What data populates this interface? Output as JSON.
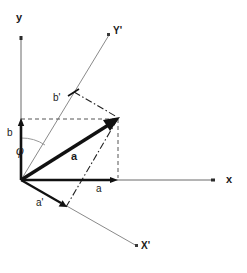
{
  "figure": {
    "name": "vector-component-transformation-diagram",
    "background_color": "#ffffff",
    "width": 247,
    "height": 273
  },
  "colors": {
    "axis": "#6b6b6b",
    "primed_axis": "#8a8a8a",
    "vector": "#111111",
    "dashed": "#555555",
    "dashdot": "#222222",
    "arc": "#9a9a9a",
    "text": "#1a1a1a"
  },
  "labels": {
    "y_axis": "y",
    "x_axis": "x",
    "y_prime_axis": "Y'",
    "x_prime_axis": "X'",
    "vector": "a",
    "component_a": "a",
    "component_b": "b",
    "component_a_prime": "a'",
    "component_b_prime": "b'",
    "angle": "φ"
  },
  "geometry": {
    "origin": {
      "x": 21,
      "y": 180
    },
    "vector_tip": {
      "x": 118,
      "y": 119
    },
    "y_axis_tip": {
      "x": 21,
      "y": 38
    },
    "x_axis_tip": {
      "x": 215,
      "y": 180
    },
    "y_prime_tip": {
      "x": 109,
      "y": 35
    },
    "x_prime_tip": {
      "x": 137,
      "y": 246
    },
    "b_component_top": {
      "x": 21,
      "y": 119
    },
    "a_component_end": {
      "x": 118,
      "y": 180
    },
    "b_prime_foot": {
      "x": 74,
      "y": 92
    },
    "a_prime_foot": {
      "x": 66,
      "y": 207
    },
    "angle_degrees": 34
  },
  "label_positions": {
    "y_axis": {
      "x": 16,
      "y": 12
    },
    "x_axis": {
      "x": 226,
      "y": 174
    },
    "y_prime_axis": {
      "x": 113,
      "y": 26
    },
    "x_prime_axis": {
      "x": 141,
      "y": 241
    },
    "vector": {
      "x": 71,
      "y": 151
    },
    "component_a": {
      "x": 96,
      "y": 184
    },
    "component_b": {
      "x": 7,
      "y": 128
    },
    "component_a_prime": {
      "x": 36,
      "y": 198
    },
    "component_b_prime": {
      "x": 53,
      "y": 93
    },
    "angle": {
      "x": 16,
      "y": 145
    }
  }
}
